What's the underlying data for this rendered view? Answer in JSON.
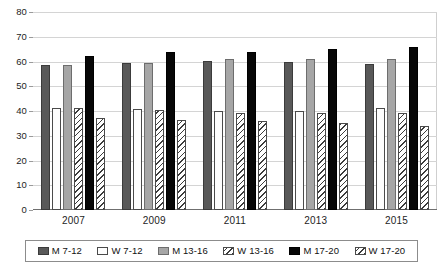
{
  "chart_data": {
    "type": "bar",
    "title": "",
    "subtitle": "",
    "xlabel": "",
    "ylabel": "",
    "categories": [
      "2007",
      "2009",
      "2011",
      "2013",
      "2015"
    ],
    "ylim": [
      0,
      80
    ],
    "yticks": [
      "0",
      "10",
      "20",
      "30",
      "40",
      "50",
      "60",
      "70",
      "80"
    ],
    "ytick_values": [
      0,
      10,
      20,
      30,
      40,
      50,
      60,
      70,
      80
    ],
    "grid": true,
    "legend_position": "bottom",
    "series": [
      {
        "name": "M 7-12",
        "values": [
          58.5,
          59.2,
          60.1,
          60.0,
          59.0
        ],
        "color": "#595959",
        "pattern": "solid"
      },
      {
        "name": "W 7-12",
        "values": [
          41.4,
          40.8,
          40.2,
          40.2,
          41.1
        ],
        "color": "#fdfdfd",
        "pattern": "solid"
      },
      {
        "name": "M 13-16",
        "values": [
          58.6,
          59.6,
          61.0,
          61.0,
          61.1
        ],
        "color": "#a6a6a6",
        "pattern": "solid"
      },
      {
        "name": "W 13-16",
        "values": [
          41.3,
          40.5,
          39.3,
          39.3,
          39.3
        ],
        "color": "#ffffff",
        "pattern": "diagonal-hatch"
      },
      {
        "name": "M 17-20",
        "values": [
          62.4,
          63.7,
          64.0,
          65.0,
          66.0
        ],
        "color": "#070707",
        "pattern": "solid"
      },
      {
        "name": "W 17-20",
        "values": [
          37.3,
          36.3,
          35.9,
          35.1,
          34.1
        ],
        "color": "#ffffff",
        "pattern": "diagonal-hatch"
      }
    ]
  },
  "legend": {
    "items": [
      {
        "label": "M 7-12"
      },
      {
        "label": "W 7-12"
      },
      {
        "label": "M 13-16"
      },
      {
        "label": "W 13-16"
      },
      {
        "label": "M 17-20"
      },
      {
        "label": "W 17-20"
      }
    ]
  }
}
